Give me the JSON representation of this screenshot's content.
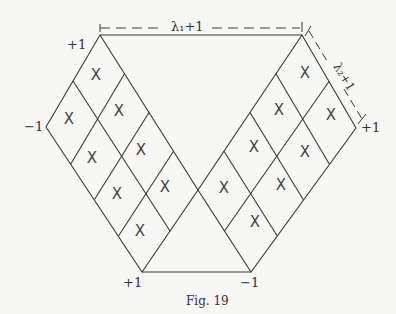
{
  "caption": "Fig. 19",
  "labels": {
    "top_left": "+1",
    "left": "−1",
    "right": "+1",
    "bottom_left": "+1",
    "bottom_right": "−1",
    "top_dimension": "λ₁+1",
    "right_dimension": "λ₂+1"
  },
  "cell_mark": "X",
  "strips": {
    "left": {
      "columns": 2,
      "rows": 4,
      "marks": 8
    },
    "right": {
      "columns": 2,
      "rows": 4,
      "marks": 8
    }
  },
  "colors": {
    "line": "#3a3a3a",
    "background": "#f7f7f5"
  }
}
